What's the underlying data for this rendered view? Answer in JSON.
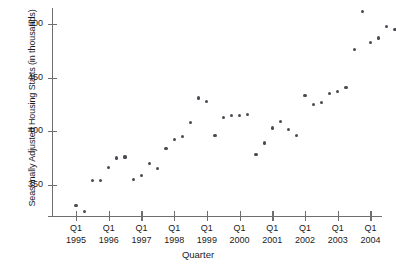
{
  "chart_data": {
    "type": "scatter",
    "title": "",
    "xlabel": "Quarter",
    "ylabel": "Seasonally Adjusted Housing Starts (in thousands)",
    "ylim": [
      320,
      515
    ],
    "yticks": [
      350,
      400,
      450,
      500
    ],
    "ytick_labels": [
      "350",
      "400",
      "450",
      "500"
    ],
    "xtick_labels": [
      {
        "quarter": "Q1",
        "year": "1995"
      },
      {
        "quarter": "Q1",
        "year": "1996"
      },
      {
        "quarter": "Q1",
        "year": "1997"
      },
      {
        "quarter": "Q1",
        "year": "1998"
      },
      {
        "quarter": "Q1",
        "year": "1999"
      },
      {
        "quarter": "Q1",
        "year": "2000"
      },
      {
        "quarter": "Q1",
        "year": "2001"
      },
      {
        "quarter": "Q1",
        "year": "2002"
      },
      {
        "quarter": "Q1",
        "year": "2003"
      },
      {
        "quarter": "Q1",
        "year": "2004"
      }
    ],
    "grid": false,
    "legend": null,
    "marker_color": "#4a4a52",
    "axis_color": "#6f6f6f",
    "x": [
      "Q1 1995",
      "Q2 1995",
      "Q3 1995",
      "Q4 1995",
      "Q1 1996",
      "Q2 1996",
      "Q3 1996",
      "Q4 1996",
      "Q1 1997",
      "Q2 1997",
      "Q3 1997",
      "Q4 1997",
      "Q1 1998",
      "Q2 1998",
      "Q3 1998",
      "Q4 1998",
      "Q1 1999",
      "Q2 1999",
      "Q3 1999",
      "Q4 1999",
      "Q1 2000",
      "Q2 2000",
      "Q3 2000",
      "Q4 2000",
      "Q1 2001",
      "Q2 2001",
      "Q3 2001",
      "Q4 2001",
      "Q1 2002",
      "Q2 2002",
      "Q3 2002",
      "Q4 2002",
      "Q1 2003",
      "Q2 2003",
      "Q3 2003",
      "Q4 2003",
      "Q1 2004",
      "Q2 2004",
      "Q3 2004",
      "Q4 2004"
    ],
    "values": [
      331,
      325,
      354,
      354,
      366,
      375,
      376,
      355,
      359,
      370,
      365,
      384,
      392,
      395,
      408,
      431,
      428,
      396,
      413,
      415,
      415,
      416,
      378,
      389,
      403,
      409,
      402,
      396,
      433,
      425,
      427,
      435,
      437,
      441,
      476,
      512,
      483,
      487,
      498,
      495
    ]
  }
}
